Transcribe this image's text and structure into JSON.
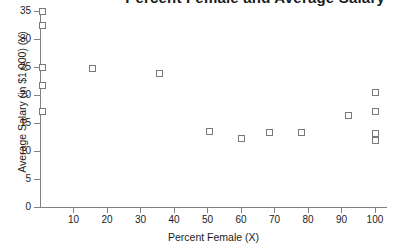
{
  "chart_data": {
    "type": "scatter",
    "title": "Percent Female and Average Salary",
    "xlabel": "Percent Female (X)",
    "ylabel": "Average Salary (in $1,000) (Y)",
    "xlim": [
      0,
      103
    ],
    "ylim": [
      0,
      35
    ],
    "xticks": [
      10,
      20,
      30,
      40,
      50,
      60,
      70,
      80,
      90,
      100
    ],
    "yticks": [
      0,
      5,
      10,
      15,
      20,
      25,
      30,
      35
    ],
    "grid": false,
    "legend": null,
    "marker": "open-square",
    "marker_color": "#7a7a7a",
    "points": [
      {
        "x": 0.5,
        "y": 35.0
      },
      {
        "x": 0.5,
        "y": 32.5
      },
      {
        "x": 0.5,
        "y": 25.0
      },
      {
        "x": 0.5,
        "y": 21.7
      },
      {
        "x": 0.5,
        "y": 17.2
      },
      {
        "x": 15.5,
        "y": 24.9
      },
      {
        "x": 35.5,
        "y": 23.9
      },
      {
        "x": 50.5,
        "y": 13.6
      },
      {
        "x": 60.0,
        "y": 12.3
      },
      {
        "x": 68.5,
        "y": 13.4
      },
      {
        "x": 78.0,
        "y": 13.4
      },
      {
        "x": 92.0,
        "y": 16.5
      },
      {
        "x": 100.0,
        "y": 20.6
      },
      {
        "x": 100.0,
        "y": 17.1
      },
      {
        "x": 100.0,
        "y": 13.2
      },
      {
        "x": 100.0,
        "y": 11.9
      }
    ]
  }
}
